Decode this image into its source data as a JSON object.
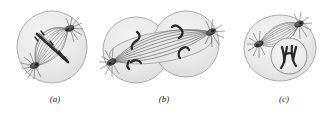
{
  "figure": {
    "kind": "biology-illustration",
    "background_color": "#ffffff",
    "panels": [
      {
        "id": "a",
        "caption": "(a)",
        "stage_name": "metaphase-anaphase",
        "cell_shape": "round",
        "cell_count": 1,
        "centrosome_count": 2,
        "nucleus_visible": false,
        "chromosome_band_visible": true,
        "caption_x": 55,
        "caption_y": 101
      },
      {
        "id": "b",
        "caption": "(b)",
        "stage_name": "telophase-cytokinesis",
        "cell_shape": "two-overlapping-lobes",
        "cell_count": 2,
        "centrosome_count": 2,
        "nucleus_visible": false,
        "chromosome_band_visible": false,
        "caption_x": 164,
        "caption_y": 101
      },
      {
        "id": "c",
        "caption": "(c)",
        "stage_name": "daughter-cell-nucleus-reformed",
        "cell_shape": "oval",
        "cell_count": 1,
        "centrosome_count": 2,
        "nucleus_visible": true,
        "chromosome_band_visible": false,
        "caption_x": 284,
        "caption_y": 101
      }
    ]
  },
  "colors": {
    "background": "#ffffff",
    "cell_fill": "#ececec",
    "cell_fill_inner": "#e2e2e2",
    "cell_outline": "#9a9a9a",
    "spindle_fiber": "#6e6e6e",
    "spindle_fiber_dark": "#4a4a4a",
    "centrosome": "#3a3a3a",
    "aster_ray": "#5a5a5a",
    "chromosome": "#2b2b2b",
    "nucleus_outline": "#7d7d7d",
    "nucleus_fill": "#eeeeee",
    "caption_text": "#1a1a1a"
  },
  "dimensions": {
    "width": 322,
    "height": 114
  }
}
